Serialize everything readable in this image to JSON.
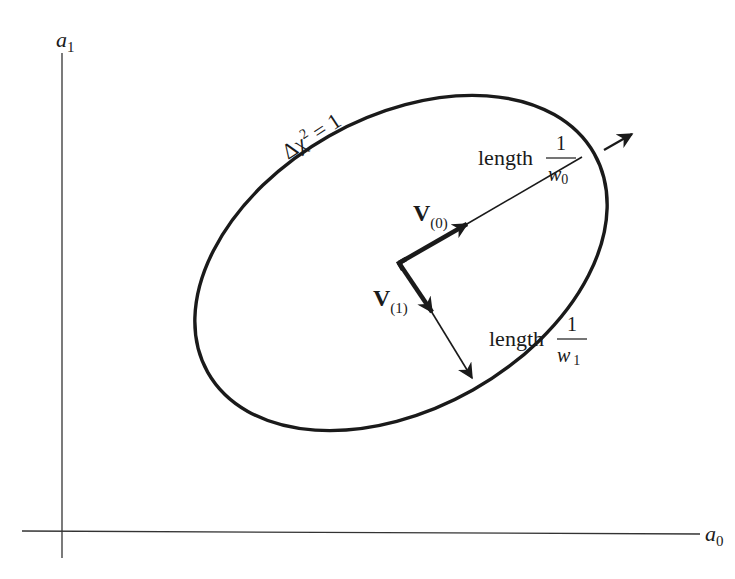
{
  "diagram": {
    "axes": {
      "x_label": {
        "base": "a",
        "sub": "0"
      },
      "y_label": {
        "base": "a",
        "sub": "1"
      }
    },
    "ellipse": {
      "label": {
        "prefix": "Δχ",
        "sup": "2",
        "suffix": " = 1"
      }
    },
    "vectors": [
      {
        "id": "v0",
        "label": {
          "base": "V",
          "sub": "(0)"
        },
        "length_label": {
          "word": "length",
          "num": "1",
          "den_base": "w",
          "den_sub": "0"
        }
      },
      {
        "id": "v1",
        "label": {
          "base": "V",
          "sub": "(1)"
        },
        "length_label": {
          "word": "length",
          "num": "1",
          "den_base": "w",
          "den_sub": "1"
        }
      }
    ]
  },
  "colors": {
    "ink": "#1a1a1a",
    "axis": "#333333",
    "background": "#ffffff"
  }
}
